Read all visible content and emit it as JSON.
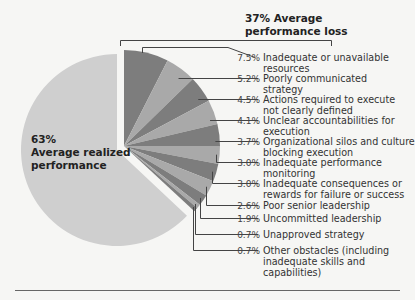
{
  "chart_data": {
    "type": "pie",
    "title": "37% Average performance loss",
    "main_slice": {
      "label": "Average realized performance",
      "value": 63,
      "display": "63%",
      "color": "#cfcfcf"
    },
    "loss_group": {
      "label": "Average performance loss",
      "value": 37,
      "display": "37%"
    },
    "slices": [
      {
        "display": "7.5%",
        "value": 7.5,
        "label": "Inadequate or unavailable resources",
        "color": "#7d7d7d"
      },
      {
        "display": "5.2%",
        "value": 5.2,
        "label": "Poorly communicated strategy",
        "color": "#a9a9a9"
      },
      {
        "display": "4.5%",
        "value": 4.5,
        "label": "Actions required to execute not clearly defined",
        "color": "#7d7d7d"
      },
      {
        "display": "4.1%",
        "value": 4.1,
        "label": "Unclear accountabilities for execution",
        "color": "#a9a9a9"
      },
      {
        "display": "3.7%",
        "value": 3.7,
        "label": "Organizational silos and culture blocking execution",
        "color": "#7d7d7d"
      },
      {
        "display": "3.0%",
        "value": 3.0,
        "label": "Inadequate performance monitoring",
        "color": "#a9a9a9"
      },
      {
        "display": "3.0%",
        "value": 3.0,
        "label": "Inadequate consequences or rewards for failure or success",
        "color": "#7d7d7d"
      },
      {
        "display": "2.6%",
        "value": 2.6,
        "label": "Poor senior leadership",
        "color": "#a9a9a9"
      },
      {
        "display": "1.9%",
        "value": 1.9,
        "label": "Uncommitted leadership",
        "color": "#7d7d7d"
      },
      {
        "display": "0.7%",
        "value": 0.7,
        "label": "Unapproved strategy",
        "color": "#a9a9a9"
      },
      {
        "display": "0.7%",
        "value": 0.7,
        "label": "Other obstacles (including inadequate skills and capabilities)",
        "color": "#7d7d7d"
      }
    ],
    "legend_position": "right"
  },
  "text": {
    "title_line1": "37% Average",
    "title_line2": "performance loss",
    "main_pct": "63%",
    "main_line1": "Average realized",
    "main_line2": "performance"
  }
}
